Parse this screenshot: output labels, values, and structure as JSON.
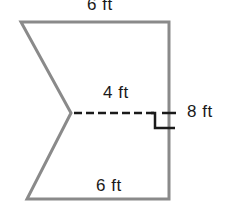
{
  "figure": {
    "type": "composite-polygon",
    "labels": {
      "top": "6 ft",
      "notch_depth": "4 ft",
      "height": "8 ft",
      "bottom": "6 ft"
    },
    "colors": {
      "line": "#8a8a8a",
      "dash": "#1a1a1a",
      "text": "#1a1a1a"
    }
  }
}
